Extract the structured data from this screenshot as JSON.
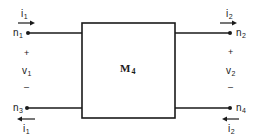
{
  "diagram": {
    "type": "two-port network",
    "block": {
      "label_base": "M",
      "label_sub": "4"
    },
    "ports": {
      "left": {
        "top_node": {
          "base": "n",
          "sub": "1"
        },
        "bottom_node": {
          "base": "n",
          "sub": "3"
        },
        "top_current": {
          "base": "i",
          "sub": "1",
          "direction": "right"
        },
        "bottom_current": {
          "base": "i",
          "sub": "1",
          "direction": "left"
        },
        "voltage": {
          "base": "v",
          "sub": "1"
        },
        "plus": "+",
        "minus": "–"
      },
      "right": {
        "top_node": {
          "base": "n",
          "sub": "2"
        },
        "bottom_node": {
          "base": "n",
          "sub": "4"
        },
        "top_current": {
          "base": "i",
          "sub": "2",
          "direction": "right"
        },
        "bottom_current": {
          "base": "i",
          "sub": "2",
          "direction": "left"
        },
        "voltage": {
          "base": "v",
          "sub": "2"
        },
        "plus": "+",
        "minus": "–"
      }
    },
    "colors": {
      "stroke": "#1a1a1a",
      "background": "#ffffff"
    }
  }
}
